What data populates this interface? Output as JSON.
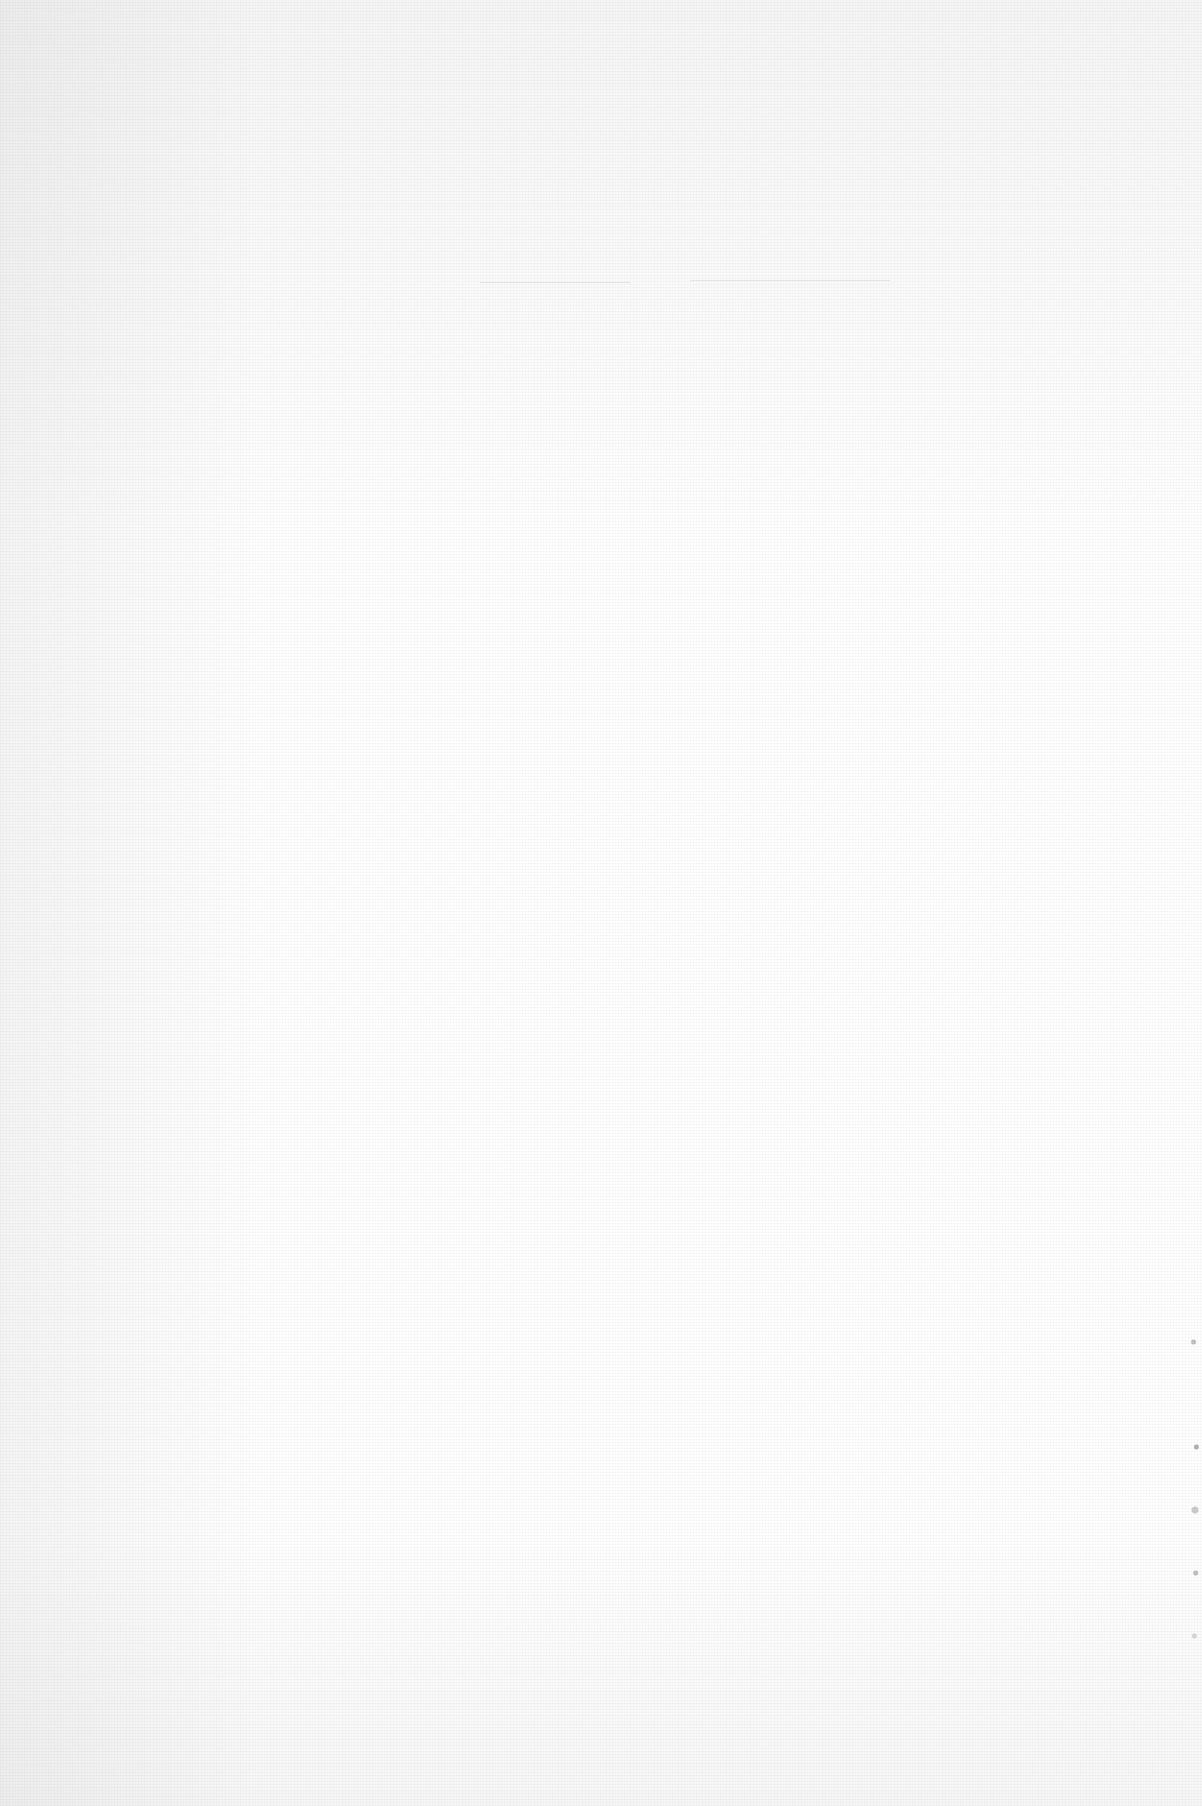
{
  "page": {
    "type": "scanned-blank-page",
    "text_content": "",
    "background_color": "#fefefe"
  }
}
